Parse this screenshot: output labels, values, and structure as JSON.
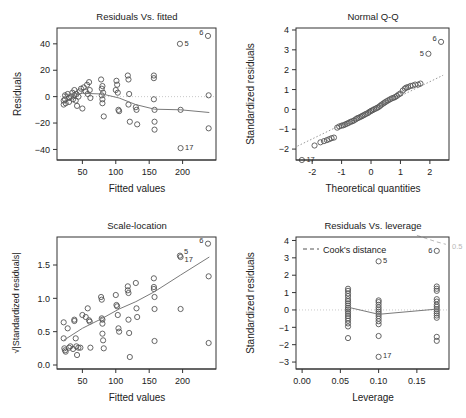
{
  "figure": {
    "name": "regression-diagnostic-plots",
    "panel_count": 4,
    "colors": {
      "point": "#555555",
      "line": "#7a7a7a",
      "reference": "#c9c9c9",
      "axis": "#222222",
      "cook": "#b8b8b8"
    }
  },
  "panels": [
    {
      "id": "residuals-vs-fitted",
      "title": "Residuals Vs. fitted",
      "xlabel": "Fitted values",
      "ylabel": "Residuals"
    },
    {
      "id": "normal-qq",
      "title": "Normal Q-Q",
      "xlabel": "Theoretical quantities",
      "ylabel": "Standardized residuals"
    },
    {
      "id": "scale-location",
      "title": "Scale-location",
      "xlabel": "Fitted values",
      "ylabel": "√|Standardized residuals|"
    },
    {
      "id": "residuals-vs-leverage",
      "title": "Residuals Vs. leverage",
      "xlabel": "Leverage",
      "ylabel": "Standardized residuals",
      "legend": "Cook's distance",
      "cook_contour_label": "0.5"
    }
  ],
  "chart_data": [
    {
      "type": "scatter",
      "id": "residuals-vs-fitted",
      "title": "Residuals Vs. fitted",
      "xlabel": "Fitted values",
      "ylabel": "Residuals",
      "xlim": [
        12,
        250
      ],
      "ylim": [
        -48,
        52
      ],
      "xticks": [
        50,
        100,
        150,
        200
      ],
      "yticks": [
        -40,
        -20,
        0,
        20,
        40
      ],
      "grid": false,
      "reference_line": {
        "type": "horizontal",
        "y": 0,
        "style": "dotted"
      },
      "points": [
        [
          22,
          -3
        ],
        [
          22,
          -6
        ],
        [
          24,
          1
        ],
        [
          24,
          -2
        ],
        [
          25,
          -5
        ],
        [
          28,
          2
        ],
        [
          30,
          -1
        ],
        [
          30,
          -4
        ],
        [
          33,
          0
        ],
        [
          35,
          3
        ],
        [
          36,
          -2
        ],
        [
          38,
          1
        ],
        [
          38,
          5
        ],
        [
          40,
          -3
        ],
        [
          41,
          2
        ],
        [
          42,
          -7
        ],
        [
          44,
          0
        ],
        [
          46,
          4
        ],
        [
          48,
          6
        ],
        [
          50,
          -9
        ],
        [
          52,
          7
        ],
        [
          55,
          4
        ],
        [
          57,
          9
        ],
        [
          58,
          2
        ],
        [
          60,
          11
        ],
        [
          61,
          5
        ],
        [
          62,
          -1
        ],
        [
          78,
          13
        ],
        [
          79,
          6
        ],
        [
          79,
          1
        ],
        [
          80,
          -2
        ],
        [
          80,
          -5
        ],
        [
          80,
          8
        ],
        [
          81,
          3
        ],
        [
          82,
          -15
        ],
        [
          100,
          5
        ],
        [
          101,
          12
        ],
        [
          102,
          9
        ],
        [
          103,
          3
        ],
        [
          104,
          -10
        ],
        [
          105,
          -11
        ],
        [
          118,
          16
        ],
        [
          119,
          13
        ],
        [
          119,
          -6
        ],
        [
          120,
          2
        ],
        [
          121,
          -19
        ],
        [
          130,
          -8
        ],
        [
          131,
          -10
        ],
        [
          132,
          -21
        ],
        [
          157,
          16
        ],
        [
          157,
          14
        ],
        [
          157,
          -2
        ],
        [
          158,
          -10
        ],
        [
          158,
          -19
        ],
        [
          158,
          -25
        ],
        [
          196,
          40
        ],
        [
          197,
          -10
        ],
        [
          197,
          -39
        ],
        [
          238,
          46
        ],
        [
          239,
          1
        ],
        [
          239,
          -24
        ]
      ],
      "smoother": [
        [
          22,
          1.5
        ],
        [
          50,
          2.5
        ],
        [
          80,
          2
        ],
        [
          105,
          -1
        ],
        [
          130,
          -6
        ],
        [
          158,
          -9.5
        ],
        [
          197,
          -10
        ],
        [
          240,
          -12
        ]
      ],
      "labeled_points": [
        {
          "label": "6",
          "x": 238,
          "y": 46
        },
        {
          "label": "5",
          "x": 196,
          "y": 40
        },
        {
          "label": "17",
          "x": 197,
          "y": -39
        }
      ]
    },
    {
      "type": "scatter",
      "id": "normal-qq",
      "title": "Normal Q-Q",
      "xlabel": "Theoretical quantities",
      "ylabel": "Standardized residuals",
      "xlim": [
        -2.55,
        2.65
      ],
      "ylim": [
        -2.55,
        4.1
      ],
      "xticks": [
        -2,
        -1,
        0,
        1,
        2
      ],
      "yticks": [
        -2,
        -1,
        0,
        1,
        2,
        3,
        4
      ],
      "grid": false,
      "reference_line": {
        "type": "qq-line",
        "style": "dotted",
        "p1": [
          -2.5,
          -1.85
        ],
        "p2": [
          2.45,
          1.72
        ]
      },
      "points": [
        [
          -2.35,
          -2.55
        ],
        [
          -1.92,
          -1.82
        ],
        [
          -1.72,
          -1.66
        ],
        [
          -1.6,
          -1.6
        ],
        [
          -1.5,
          -1.55
        ],
        [
          -1.42,
          -1.5
        ],
        [
          -1.34,
          -1.45
        ],
        [
          -1.26,
          -1.42
        ],
        [
          -1.15,
          -0.92
        ],
        [
          -1.08,
          -0.86
        ],
        [
          -1.0,
          -0.82
        ],
        [
          -0.94,
          -0.8
        ],
        [
          -0.88,
          -0.76
        ],
        [
          -0.82,
          -0.72
        ],
        [
          -0.76,
          -0.68
        ],
        [
          -0.7,
          -0.63
        ],
        [
          -0.64,
          -0.6
        ],
        [
          -0.58,
          -0.56
        ],
        [
          -0.52,
          -0.5
        ],
        [
          -0.47,
          -0.45
        ],
        [
          -0.42,
          -0.42
        ],
        [
          -0.36,
          -0.38
        ],
        [
          -0.31,
          -0.34
        ],
        [
          -0.26,
          -0.3
        ],
        [
          -0.21,
          -0.26
        ],
        [
          -0.16,
          -0.22
        ],
        [
          -0.1,
          -0.18
        ],
        [
          -0.05,
          -0.12
        ],
        [
          0,
          -0.08
        ],
        [
          0.05,
          -0.04
        ],
        [
          0.1,
          0
        ],
        [
          0.16,
          0.04
        ],
        [
          0.21,
          0.08
        ],
        [
          0.26,
          0.12
        ],
        [
          0.31,
          0.18
        ],
        [
          0.36,
          0.24
        ],
        [
          0.42,
          0.3
        ],
        [
          0.47,
          0.35
        ],
        [
          0.52,
          0.4
        ],
        [
          0.58,
          0.45
        ],
        [
          0.64,
          0.5
        ],
        [
          0.7,
          0.55
        ],
        [
          0.76,
          0.58
        ],
        [
          0.82,
          0.62
        ],
        [
          0.88,
          0.68
        ],
        [
          0.94,
          0.75
        ],
        [
          1.0,
          0.8
        ],
        [
          1.08,
          0.95
        ],
        [
          1.15,
          1.05
        ],
        [
          1.2,
          1.1
        ],
        [
          1.26,
          1.12
        ],
        [
          1.34,
          1.18
        ],
        [
          1.42,
          1.2
        ],
        [
          1.5,
          1.25
        ],
        [
          1.6,
          1.25
        ],
        [
          1.68,
          1.3
        ],
        [
          1.95,
          2.8
        ],
        [
          2.38,
          3.4
        ]
      ],
      "labeled_points": [
        {
          "label": "6",
          "x": 2.38,
          "y": 3.4
        },
        {
          "label": "5",
          "x": 1.95,
          "y": 2.8
        },
        {
          "label": "17",
          "x": -2.35,
          "y": -2.55
        }
      ]
    },
    {
      "type": "scatter",
      "id": "scale-location",
      "title": "Scale-location",
      "xlabel": "Fitted values",
      "ylabel": "√|Standardized residuals|",
      "xlim": [
        12,
        250
      ],
      "ylim": [
        -0.06,
        1.92
      ],
      "xticks": [
        50,
        100,
        150,
        200
      ],
      "yticks": [
        0.0,
        0.5,
        1.0,
        1.5
      ],
      "grid": false,
      "points": [
        [
          22,
          0.64
        ],
        [
          22,
          0.4
        ],
        [
          23,
          0.25
        ],
        [
          24,
          0.22
        ],
        [
          25,
          0.2
        ],
        [
          28,
          0.55
        ],
        [
          30,
          0.26
        ],
        [
          32,
          0.28
        ],
        [
          36,
          0.24
        ],
        [
          38,
          0.68
        ],
        [
          38,
          0.66
        ],
        [
          40,
          0.4
        ],
        [
          41,
          0.28
        ],
        [
          42,
          0.15
        ],
        [
          44,
          0.26
        ],
        [
          47,
          0.26
        ],
        [
          50,
          0.75
        ],
        [
          55,
          0.72
        ],
        [
          58,
          0.85
        ],
        [
          60,
          0.67
        ],
        [
          61,
          0.65
        ],
        [
          62,
          0.26
        ],
        [
          78,
          1.02
        ],
        [
          79,
          0.98
        ],
        [
          79,
          0.7
        ],
        [
          80,
          0.68
        ],
        [
          80,
          0.62
        ],
        [
          80,
          0.47
        ],
        [
          81,
          0.37
        ],
        [
          82,
          0.25
        ],
        [
          100,
          1.05
        ],
        [
          101,
          0.9
        ],
        [
          102,
          0.88
        ],
        [
          103,
          0.75
        ],
        [
          104,
          0.55
        ],
        [
          105,
          0.5
        ],
        [
          118,
          1.18
        ],
        [
          118,
          1.12
        ],
        [
          119,
          1.08
        ],
        [
          119,
          0.68
        ],
        [
          120,
          0.48
        ],
        [
          121,
          0.12
        ],
        [
          130,
          1.23
        ],
        [
          131,
          0.85
        ],
        [
          132,
          0.72
        ],
        [
          157,
          1.3
        ],
        [
          157,
          1.17
        ],
        [
          157,
          1.14
        ],
        [
          158,
          1.02
        ],
        [
          158,
          0.84
        ],
        [
          158,
          0.36
        ],
        [
          196,
          1.64
        ],
        [
          197,
          1.62
        ],
        [
          197,
          0.84
        ],
        [
          238,
          1.82
        ],
        [
          239,
          1.33
        ],
        [
          239,
          0.33
        ]
      ],
      "smoother": [
        [
          22,
          0.37
        ],
        [
          50,
          0.55
        ],
        [
          80,
          0.7
        ],
        [
          105,
          0.84
        ],
        [
          130,
          0.95
        ],
        [
          158,
          1.1
        ],
        [
          197,
          1.35
        ],
        [
          240,
          1.62
        ]
      ],
      "labeled_points": [
        {
          "label": "6",
          "x": 238,
          "y": 1.82
        },
        {
          "label": "5",
          "x": 196,
          "y": 1.64
        },
        {
          "label": "17",
          "x": 197,
          "y": 1.62
        }
      ]
    },
    {
      "type": "scatter",
      "id": "residuals-vs-leverage",
      "title": "Residuals Vs. leverage",
      "xlabel": "Leverage",
      "ylabel": "Standardized residuals",
      "legend": "Cook's distance",
      "cook_contour_label": "0.5",
      "xlim": [
        -0.008,
        0.192
      ],
      "ylim": [
        -3.4,
        4.2
      ],
      "xticks": [
        0.0,
        0.05,
        0.1,
        0.15
      ],
      "yticks": [
        -3,
        -2,
        -1,
        0,
        1,
        2,
        3,
        4
      ],
      "grid": false,
      "reference_line": {
        "type": "horizontal",
        "y": 0,
        "style": "dotted"
      },
      "points": [
        [
          0.06,
          1.22
        ],
        [
          0.06,
          1.1
        ],
        [
          0.06,
          0.95
        ],
        [
          0.06,
          0.8
        ],
        [
          0.06,
          0.62
        ],
        [
          0.06,
          0.5
        ],
        [
          0.06,
          0.38
        ],
        [
          0.06,
          0.25
        ],
        [
          0.06,
          0.12
        ],
        [
          0.06,
          0.02
        ],
        [
          0.06,
          -0.1
        ],
        [
          0.06,
          -0.22
        ],
        [
          0.06,
          -0.35
        ],
        [
          0.06,
          -0.48
        ],
        [
          0.06,
          -0.62
        ],
        [
          0.06,
          -0.78
        ],
        [
          0.06,
          -0.95
        ],
        [
          0.06,
          -1.62
        ],
        [
          0.1,
          0.55
        ],
        [
          0.1,
          0.45
        ],
        [
          0.1,
          0.3
        ],
        [
          0.1,
          0.15
        ],
        [
          0.1,
          0.02
        ],
        [
          0.1,
          -0.1
        ],
        [
          0.1,
          -0.22
        ],
        [
          0.1,
          -0.35
        ],
        [
          0.1,
          -0.5
        ],
        [
          0.1,
          -0.65
        ],
        [
          0.1,
          -0.82
        ],
        [
          0.1,
          -1.5
        ],
        [
          0.1,
          -2.7
        ],
        [
          0.1,
          2.8
        ],
        [
          0.176,
          1.35
        ],
        [
          0.176,
          1.22
        ],
        [
          0.176,
          1.1
        ],
        [
          0.176,
          0.62
        ],
        [
          0.176,
          0.48
        ],
        [
          0.176,
          0.3
        ],
        [
          0.176,
          0.18
        ],
        [
          0.176,
          0.05
        ],
        [
          0.176,
          -0.08
        ],
        [
          0.176,
          -0.2
        ],
        [
          0.176,
          -0.32
        ],
        [
          0.176,
          -0.45
        ],
        [
          0.176,
          -1.55
        ],
        [
          0.176,
          -1.78
        ],
        [
          0.176,
          3.4
        ]
      ],
      "smoother": [
        [
          0.06,
          0.16
        ],
        [
          0.1,
          -0.25
        ],
        [
          0.176,
          0.05
        ]
      ],
      "cook_curve": [
        [
          0.15,
          4.3
        ],
        [
          0.162,
          4.12
        ],
        [
          0.176,
          3.92
        ],
        [
          0.188,
          3.78
        ]
      ],
      "labeled_points": [
        {
          "label": "6",
          "x": 0.176,
          "y": 3.4
        },
        {
          "label": "5",
          "x": 0.1,
          "y": 2.8
        },
        {
          "label": "17",
          "x": 0.1,
          "y": -2.7
        }
      ]
    }
  ]
}
